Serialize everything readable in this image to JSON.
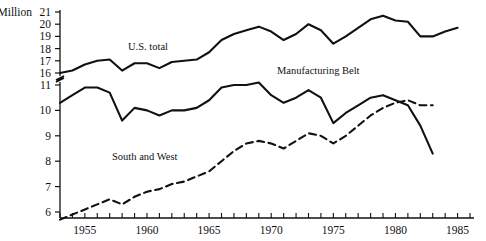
{
  "chart_data": {
    "type": "line",
    "title": "",
    "subtitle": "",
    "unit_label": "Million",
    "xlabel": "",
    "ylabel": "",
    "xlim": [
      1953,
      1986
    ],
    "xticks": [
      1953,
      1954,
      1955,
      1956,
      1957,
      1958,
      1959,
      1960,
      1961,
      1962,
      1963,
      1964,
      1965,
      1966,
      1967,
      1968,
      1969,
      1970,
      1971,
      1972,
      1973,
      1974,
      1975,
      1976,
      1977,
      1978,
      1979,
      1980,
      1981,
      1982,
      1983,
      1984,
      1985,
      1986
    ],
    "xtick_labels": [
      "1955",
      "1960",
      "1965",
      "1970",
      "1975",
      "1980",
      "1985"
    ],
    "xtick_label_values": [
      1955,
      1960,
      1965,
      1970,
      1975,
      1980,
      1985
    ],
    "grid": false,
    "legend_position": "inline-annotations",
    "axis_break": {
      "present": true,
      "between": [
        11,
        16
      ],
      "marker": "zigzag"
    },
    "yticks_upper": [
      16,
      17,
      18,
      19,
      20,
      21
    ],
    "yticks_lower": [
      6,
      7,
      8,
      9,
      10,
      11
    ],
    "ylim_upper": [
      16,
      21
    ],
    "ylim_lower": [
      5.6,
      11
    ],
    "series": [
      {
        "name": "U.S. total",
        "style": "solid",
        "color": "#111111",
        "x": [
          1953,
          1954,
          1955,
          1956,
          1957,
          1958,
          1959,
          1960,
          1961,
          1962,
          1963,
          1964,
          1965,
          1966,
          1967,
          1968,
          1969,
          1970,
          1971,
          1972,
          1973,
          1974,
          1975,
          1976,
          1977,
          1978,
          1979,
          1980,
          1981,
          1982,
          1983,
          1984,
          1985
        ],
        "values": [
          16.0,
          16.2,
          16.7,
          17.0,
          17.1,
          16.2,
          16.8,
          16.8,
          16.4,
          16.9,
          17.0,
          17.1,
          17.7,
          18.7,
          19.2,
          19.5,
          19.8,
          19.4,
          18.7,
          19.2,
          20.0,
          19.5,
          18.4,
          19.0,
          19.7,
          20.4,
          20.7,
          20.3,
          20.2,
          19.0,
          19.0,
          19.4,
          19.7
        ]
      },
      {
        "name": "Manufacturing Belt",
        "style": "solid",
        "color": "#111111",
        "x": [
          1953,
          1954,
          1955,
          1956,
          1957,
          1958,
          1959,
          1960,
          1961,
          1962,
          1963,
          1964,
          1965,
          1966,
          1967,
          1968,
          1969,
          1970,
          1971,
          1972,
          1973,
          1974,
          1975,
          1976,
          1977,
          1978,
          1979,
          1980,
          1981,
          1982,
          1983
        ],
        "values": [
          10.3,
          10.6,
          10.9,
          10.9,
          10.7,
          9.6,
          10.1,
          10.0,
          9.8,
          10.0,
          10.0,
          10.1,
          10.4,
          10.9,
          11.0,
          11.0,
          11.1,
          10.6,
          10.3,
          10.5,
          10.8,
          10.5,
          9.5,
          9.9,
          10.2,
          10.5,
          10.6,
          10.4,
          10.2,
          9.4,
          8.3
        ]
      },
      {
        "name": "South and West",
        "style": "dashed",
        "color": "#111111",
        "x": [
          1953,
          1954,
          1955,
          1956,
          1957,
          1958,
          1959,
          1960,
          1961,
          1962,
          1963,
          1964,
          1965,
          1966,
          1967,
          1968,
          1969,
          1970,
          1971,
          1972,
          1973,
          1974,
          1975,
          1976,
          1977,
          1978,
          1979,
          1980,
          1981,
          1982,
          1983
        ],
        "values": [
          5.7,
          5.9,
          6.1,
          6.3,
          6.5,
          6.3,
          6.6,
          6.8,
          6.9,
          7.1,
          7.2,
          7.4,
          7.6,
          8.0,
          8.4,
          8.7,
          8.8,
          8.7,
          8.5,
          8.8,
          9.1,
          9.0,
          8.7,
          9.0,
          9.4,
          9.8,
          10.1,
          10.3,
          10.4,
          10.2,
          10.2
        ]
      }
    ]
  },
  "annotations": [
    {
      "name": "us-total-label",
      "text": "U.S. total",
      "x_px": 128,
      "y_px": 50
    },
    {
      "name": "manufacturing-belt-label",
      "text": "Manufacturing Belt",
      "x_px": 277,
      "y_px": 74
    },
    {
      "name": "south-and-west-label",
      "text": "South and West",
      "x_px": 112,
      "y_px": 160
    }
  ]
}
